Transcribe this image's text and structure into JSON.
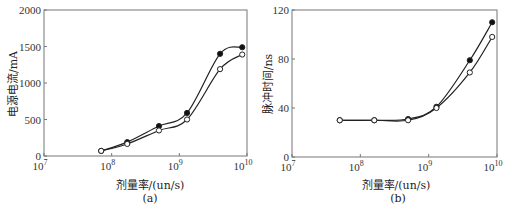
{
  "chart_data": [
    {
      "id": "a",
      "type": "line",
      "caption": "(a)",
      "title": "",
      "xlabel": "剂量率/(un/s)",
      "ylabel": "电源电流/mA",
      "xscale": "log",
      "xlim": [
        10000000,
        10000000000
      ],
      "ylim": [
        0,
        2000
      ],
      "x_ticks": [
        "10^7",
        "10^8",
        "10^9",
        "10^10"
      ],
      "y_ticks": [
        0,
        500,
        1000,
        1500,
        2000
      ],
      "grid": false,
      "legend": "none",
      "x": [
        70000000,
        170000000,
        500000000,
        1300000000,
        4000000000,
        8500000000
      ],
      "series": [
        {
          "name": "filled-markers",
          "marker": "filled-circle",
          "values": [
            70,
            190,
            410,
            590,
            1400,
            1490
          ]
        },
        {
          "name": "open-markers",
          "marker": "open-circle",
          "values": [
            70,
            165,
            350,
            500,
            1190,
            1390
          ]
        }
      ]
    },
    {
      "id": "b",
      "type": "line",
      "caption": "(b)",
      "title": "",
      "xlabel": "剂量率/(un/s)",
      "ylabel": "脉冲时间/ns",
      "xscale": "log",
      "xlim": [
        10000000,
        10000000000
      ],
      "ylim": [
        0,
        120
      ],
      "x_ticks": [
        "10^7",
        "10^8",
        "10^9",
        "10^10"
      ],
      "y_ticks": [
        0,
        40,
        80,
        120
      ],
      "grid": false,
      "legend": "none",
      "x": [
        50000000,
        160000000,
        500000000,
        1300000000,
        4000000000,
        8500000000
      ],
      "series": [
        {
          "name": "filled-markers",
          "marker": "filled-circle",
          "values": [
            30,
            30,
            31,
            41,
            79,
            110
          ]
        },
        {
          "name": "open-markers",
          "marker": "open-circle",
          "values": [
            30,
            30,
            30,
            40,
            69,
            98
          ]
        }
      ]
    }
  ],
  "labels": {
    "a": {
      "xlabel": "剂量率/(un/s)",
      "ylabel": "电源电流/mA",
      "caption": "(a)"
    },
    "b": {
      "xlabel": "剂量率/(un/s)",
      "ylabel": "脉冲时间/ns",
      "caption": "(b)"
    }
  },
  "colors": {
    "line": "#222222",
    "axis": "#777777",
    "marker_fill": "#111111",
    "marker_open": "#ffffff"
  }
}
